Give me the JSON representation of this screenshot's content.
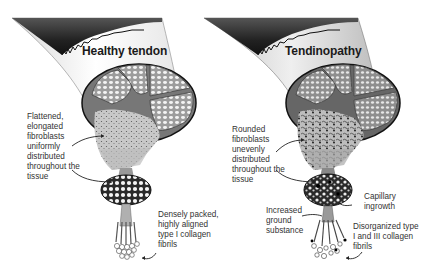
{
  "panels": [
    {
      "id": "healthy",
      "title": "Healthy tendon",
      "labels": [
        {
          "key": "fibroblasts",
          "text": "Flattened,\nelongated\nfibroblasts\nuniformly\ndistributed\nthroughout the\ntissue"
        },
        {
          "key": "fibrils",
          "text": "Densely packed,\nhighly aligned\ntype I collagen\nfibrils"
        }
      ]
    },
    {
      "id": "tendinopathy",
      "title": "Tendinopathy",
      "labels": [
        {
          "key": "fibroblasts",
          "text": "Rounded\nfibroblasts\nunevenly\ndistributed\nthroughout the\ntissue"
        },
        {
          "key": "capillary",
          "text": "Capillary\ningrowth"
        },
        {
          "key": "ground",
          "text": "Increased\nground\nsubstance"
        },
        {
          "key": "fibrils",
          "text": "Disorganized type\nI and III collagen\nfibrils"
        }
      ]
    }
  ],
  "colors": {
    "muscle_dark": "#2a2a2a",
    "tendon_light": "#eeeeee",
    "fascicle_fill": "#9a9a9a",
    "outline": "#222222",
    "text": "#333333"
  }
}
